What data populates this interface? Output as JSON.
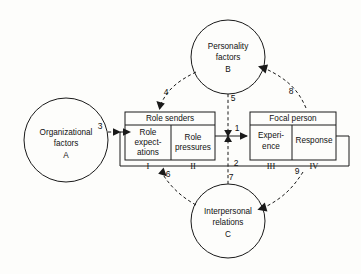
{
  "diagram": {
    "canvas": {
      "width": 361,
      "height": 274
    },
    "background_color": "#fdfdfb",
    "line_color": "#1a1a1a",
    "text_color": "#111111",
    "circles": [
      {
        "id": "A",
        "name": "organizational-factors",
        "line1": "Organizational",
        "line2": "factors",
        "letter": "A",
        "cx": 66,
        "cy": 140,
        "r": 42
      },
      {
        "id": "B",
        "name": "personality-factors",
        "line1": "Personality",
        "line2": "factors",
        "letter": "B",
        "cx": 228,
        "cy": 57,
        "r": 37
      },
      {
        "id": "C",
        "name": "interpersonal-relations",
        "line1": "Interpersonal",
        "line2": "relations",
        "letter": "C",
        "cx": 228,
        "cy": 221,
        "r": 37
      }
    ],
    "boxes": [
      {
        "id": "role-senders",
        "title": "Role senders",
        "x": 125,
        "y": 112,
        "width": 90,
        "height": 48,
        "header_height": 13,
        "divider_x": 171,
        "cells": [
          {
            "id": "I",
            "lines": [
              "Role",
              "expect-",
              "ations"
            ],
            "roman": "I",
            "roman_x": 148
          },
          {
            "id": "II",
            "lines": [
              "Role",
              "pressures"
            ],
            "roman": "II",
            "roman_x": 193
          }
        ]
      },
      {
        "id": "focal-person",
        "title": "Focal person",
        "x": 250,
        "y": 112,
        "width": 86,
        "height": 48,
        "header_height": 13,
        "divider_x": 292,
        "cells": [
          {
            "id": "III",
            "lines": [
              "Experi-",
              "ence"
            ],
            "roman": "III",
            "roman_x": 271
          },
          {
            "id": "IV",
            "lines": [
              "Response"
            ],
            "roman": "IV",
            "roman_x": 314
          }
        ]
      }
    ],
    "arrows": [
      {
        "id": "3",
        "label": "3",
        "style": "dashed",
        "label_x": 100,
        "label_y": 129,
        "from": "A",
        "to": "role-senders"
      },
      {
        "id": "4",
        "label": "4",
        "style": "dashed",
        "label_x": 164,
        "label_y": 94,
        "from": "B",
        "to": "role-senders"
      },
      {
        "id": "5",
        "label": "5",
        "style": "dashed",
        "label_x": 232,
        "label_y": 99,
        "from": "B",
        "to": "junction"
      },
      {
        "id": "1",
        "label": "1",
        "style": "solid",
        "label_x": 237,
        "label_y": 130,
        "from": "role-senders",
        "to": "focal-person"
      },
      {
        "id": "2",
        "label": "2",
        "style": "solid",
        "label_x": 236,
        "label_y": 165,
        "from": "focal-person",
        "to": "role-senders"
      },
      {
        "id": "8",
        "label": "8",
        "style": "dashed",
        "label_x": 290,
        "label_y": 92,
        "from": "focal-person",
        "to": "B"
      },
      {
        "id": "6",
        "label": "6",
        "style": "dashed",
        "label_x": 165,
        "label_y": 173,
        "from": "C",
        "to": "role-senders"
      },
      {
        "id": "7",
        "label": "7",
        "style": "dashed",
        "label_x": 230,
        "label_y": 176,
        "from": "C",
        "to": "junction"
      },
      {
        "id": "9",
        "label": "9",
        "style": "dashed",
        "label_x": 296,
        "label_y": 173,
        "from": "focal-person",
        "to": "C"
      }
    ]
  }
}
